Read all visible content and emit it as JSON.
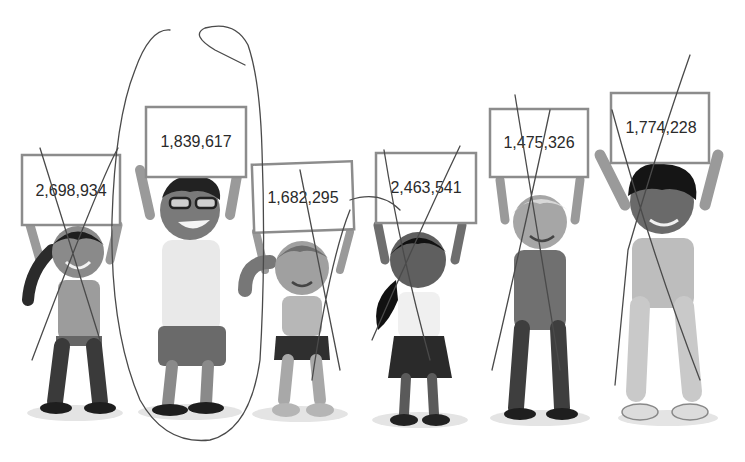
{
  "scene": {
    "description": "Six children holding up signs with numbers",
    "signs": [
      {
        "value": "2,698,934",
        "annotation": "crossed-out"
      },
      {
        "value": "1,839,617",
        "annotation": "circled"
      },
      {
        "value": "1,682,295",
        "annotation": "crossed-out"
      },
      {
        "value": "2,463,541",
        "annotation": "crossed-out"
      },
      {
        "value": "1,475,326",
        "annotation": "crossed-out"
      },
      {
        "value": "1,774,228",
        "annotation": "crossed-out"
      }
    ]
  }
}
